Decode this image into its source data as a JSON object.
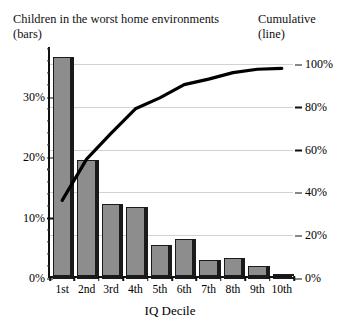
{
  "header": {
    "left_caption": "Children in the worst home environments\n(bars)",
    "right_caption": "Cumulative\n(line)"
  },
  "chart_data": {
    "type": "bar",
    "title": "Children in the worst home environments (bars)",
    "subtitle": "Cumulative (line)",
    "xlabel": "IQ Decile",
    "ylabel": "",
    "categories": [
      "1st",
      "2nd",
      "3rd",
      "4th",
      "5th",
      "6th",
      "7th",
      "8th",
      "9th",
      "10th"
    ],
    "series": [
      {
        "name": "Children in the worst home environments (bars)",
        "type": "bar",
        "axis": "left",
        "values": [
          36.3,
          19.3,
          12.0,
          11.5,
          5.1,
          6.2,
          2.6,
          3.0,
          1.6,
          0.4
        ]
      },
      {
        "name": "Cumulative (line)",
        "type": "line",
        "axis": "right",
        "values": [
          36.3,
          55.6,
          67.6,
          79.1,
          84.2,
          90.4,
          93.0,
          96.0,
          97.6,
          98.0
        ]
      }
    ],
    "left_axis": {
      "ticks": [
        "0%",
        "10%",
        "20%",
        "30%"
      ],
      "tick_values": [
        0,
        10,
        20,
        30
      ],
      "lim": [
        0,
        38.3
      ],
      "minor_ticks": true
    },
    "right_axis": {
      "ticks": [
        "0%",
        "20%",
        "40%",
        "60%",
        "80%",
        "100%"
      ],
      "tick_values": [
        0,
        20,
        40,
        60,
        80,
        100
      ],
      "lim": [
        0,
        108
      ]
    },
    "grid": true,
    "grid_color": "#d2d2d2",
    "bar_color": "#8d8d8d",
    "bar_edge_color": "#1a1a1a",
    "line_color": "#000000",
    "legend": "none"
  },
  "xaxis_title": "IQ Decile"
}
